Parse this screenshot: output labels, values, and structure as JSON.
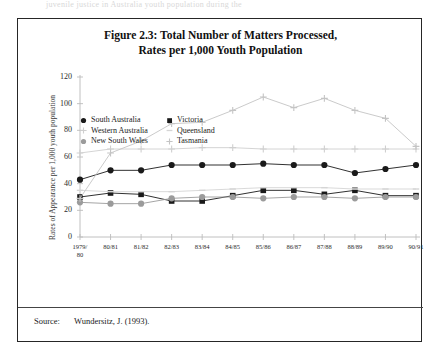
{
  "running_head": "juvenile justice in Australia youth population during the",
  "figure": {
    "title_line1": "Figure 2.3: Total Number of Matters Processed,",
    "title_line2": "Rates per 1,000 Youth Population"
  },
  "source": {
    "label": "Source:",
    "text": "Wundersitz, J. (1993)."
  },
  "legend": {
    "columns": [
      [
        {
          "label": "South Australia",
          "marker": "filled-circle",
          "color": "#1a1a1a"
        },
        {
          "label": "Western Australia",
          "marker": "plus",
          "color": "#cfcfcf"
        },
        {
          "label": "New South Wales",
          "marker": "filled-circle",
          "color": "#9b9b9b"
        }
      ],
      [
        {
          "label": "Victoria",
          "marker": "filled-square",
          "color": "#1a1a1a"
        },
        {
          "label": "Queensland",
          "marker": "dash",
          "color": "#d5d5d5"
        },
        {
          "label": "Tasmania",
          "marker": "plus",
          "color": "#c4c4c4"
        }
      ]
    ]
  },
  "chart_data": {
    "type": "line",
    "title": "Figure 2.3: Total Number of Matters Processed, Rates per 1,000 Youth Population",
    "xlabel": "",
    "ylabel": "Rates  of  Appearance  per  1,000  youth  population",
    "categories": [
      "1979/80",
      "80/81",
      "81/82",
      "82/83",
      "83/84",
      "84/85",
      "85/86",
      "86/87",
      "87/88",
      "88/89",
      "89/90",
      "90/91"
    ],
    "ylim": [
      0,
      120
    ],
    "yticks": [
      0,
      20,
      40,
      60,
      80,
      100,
      120
    ],
    "grid": false,
    "legend_position": "top-left-inside",
    "series": [
      {
        "name": "South Australia",
        "color": "#1a1a1a",
        "marker": "filled-circle",
        "values": [
          43,
          50,
          50,
          54,
          54,
          54,
          55,
          54,
          54,
          48,
          51,
          54
        ]
      },
      {
        "name": "Victoria",
        "color": "#1a1a1a",
        "marker": "filled-square",
        "values": [
          30,
          33,
          32,
          27,
          27,
          31,
          35,
          35,
          32,
          35,
          31,
          31
        ]
      },
      {
        "name": "New South Wales",
        "color": "#9b9b9b",
        "marker": "filled-circle",
        "values": [
          26,
          25,
          25,
          29,
          30,
          30,
          29,
          30,
          30,
          29,
          30,
          30
        ]
      },
      {
        "name": "Western Australia",
        "color": "#cfcfcf",
        "marker": "plus",
        "values": [
          63,
          66,
          66,
          66,
          67,
          67,
          66,
          66,
          66,
          66,
          66,
          66
        ]
      },
      {
        "name": "Queensland",
        "color": "#d5d5d5",
        "marker": "dash",
        "values": [
          35,
          34,
          34,
          34,
          35,
          36,
          37,
          37,
          37,
          36,
          36,
          36
        ]
      },
      {
        "name": "Tasmania",
        "color": "#c4c4c4",
        "marker": "plus",
        "values": [
          29,
          63,
          72,
          85,
          86,
          95,
          105,
          97,
          104,
          95,
          89,
          68
        ]
      }
    ]
  }
}
